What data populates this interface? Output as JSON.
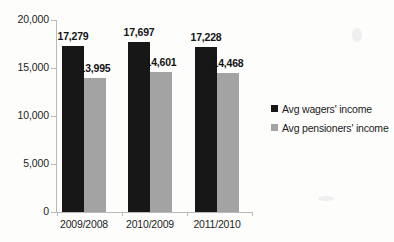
{
  "chart_data": {
    "type": "bar",
    "title": "",
    "subtitle": "",
    "xlabel": "",
    "ylabel": "",
    "categories": [
      "2009/2008",
      "2010/2009",
      "2011/2010"
    ],
    "series": [
      {
        "name": "Avg wagers' income",
        "color": "#171717",
        "values": [
          17279,
          17697,
          17228
        ],
        "labels": [
          "17,279",
          "17,697",
          "17,228"
        ]
      },
      {
        "name": "Avg pensioners' income",
        "color": "#a3a3a3",
        "values": [
          13995,
          14601,
          14468
        ],
        "labels": [
          "13,995",
          "14,601",
          "14,468"
        ]
      }
    ],
    "ylim": [
      0,
      20000
    ],
    "yticks": [
      0,
      5000,
      10000,
      15000,
      20000
    ],
    "ytick_labels": [
      "0",
      "5,000",
      "10,000",
      "15,000",
      "20,000"
    ],
    "grid": false,
    "legend_position": "right",
    "data_labels_shown": true
  },
  "legend": {
    "items": [
      {
        "label": "Avg wagers' income",
        "swatch": "legend-swatch-black"
      },
      {
        "label": "Avg pensioners' income",
        "swatch": "legend-swatch-gray"
      }
    ]
  }
}
